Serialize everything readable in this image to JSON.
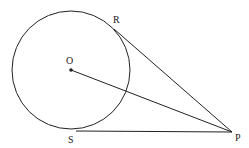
{
  "diagram": {
    "type": "circle-with-tangents",
    "circle": {
      "center": [
        71,
        70
      ],
      "radius": 59
    },
    "points": {
      "O": {
        "label": "O",
        "x": 71,
        "y": 70
      },
      "R": {
        "label": "R",
        "x": 114,
        "y": 29
      },
      "S": {
        "label": "S",
        "x": 76,
        "y": 131
      },
      "P": {
        "label": "P",
        "x": 232,
        "y": 132
      }
    },
    "segments": [
      {
        "from": "R",
        "to": "P"
      },
      {
        "from": "S",
        "to": "P"
      },
      {
        "from": "O",
        "to": "P"
      }
    ],
    "stroke_color": "#222222"
  }
}
